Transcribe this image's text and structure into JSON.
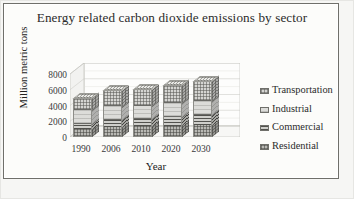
{
  "chart_data": {
    "type": "bar",
    "subtype": "stacked-column-3d",
    "title": "Energy related carbon dioxide emissions by sector",
    "xlabel": "Year",
    "ylabel": "Million metric tons",
    "categories": [
      "1990",
      "2006",
      "2010",
      "2020",
      "2030"
    ],
    "ylim": [
      0,
      8000
    ],
    "yticks": [
      "8000",
      "6000",
      "4000",
      "2000",
      "0"
    ],
    "ytick_values": [
      8000,
      6000,
      4000,
      2000,
      0
    ],
    "grid": true,
    "legend_position": "right",
    "series": [
      {
        "name": "Residential",
        "values": [
          950,
          1200,
          1230,
          1320,
          1420
        ]
      },
      {
        "name": "Commercial",
        "values": [
          760,
          980,
          1020,
          1180,
          1340
        ]
      },
      {
        "name": "Industrial",
        "values": [
          1680,
          1710,
          1700,
          1760,
          1830
        ]
      },
      {
        "name": "Transportation",
        "values": [
          1560,
          1980,
          2040,
          2300,
          2520
        ]
      }
    ],
    "stack_totals": [
      4950,
      5870,
      5990,
      6560,
      7110
    ],
    "stack_order_bottom_to_top": [
      "Residential",
      "Commercial",
      "Industrial",
      "Transportation"
    ],
    "colors": {
      "transportation": "#d5d5d2",
      "industrial": "#dcdcd9",
      "commercial": "#cfcfcb",
      "residential": "#b9b9b4",
      "axis_text": "#3a3a3a",
      "title_text": "#2b2b2b",
      "frame": "#6f6f6a",
      "plot_bg": "#fcfcfa"
    }
  },
  "legend": {
    "items": [
      {
        "label": "Transportation",
        "pattern": "transportation"
      },
      {
        "label": "Industrial",
        "pattern": "industrial"
      },
      {
        "label": "Commercial",
        "pattern": "commercial"
      },
      {
        "label": "Residential",
        "pattern": "residential"
      }
    ]
  }
}
